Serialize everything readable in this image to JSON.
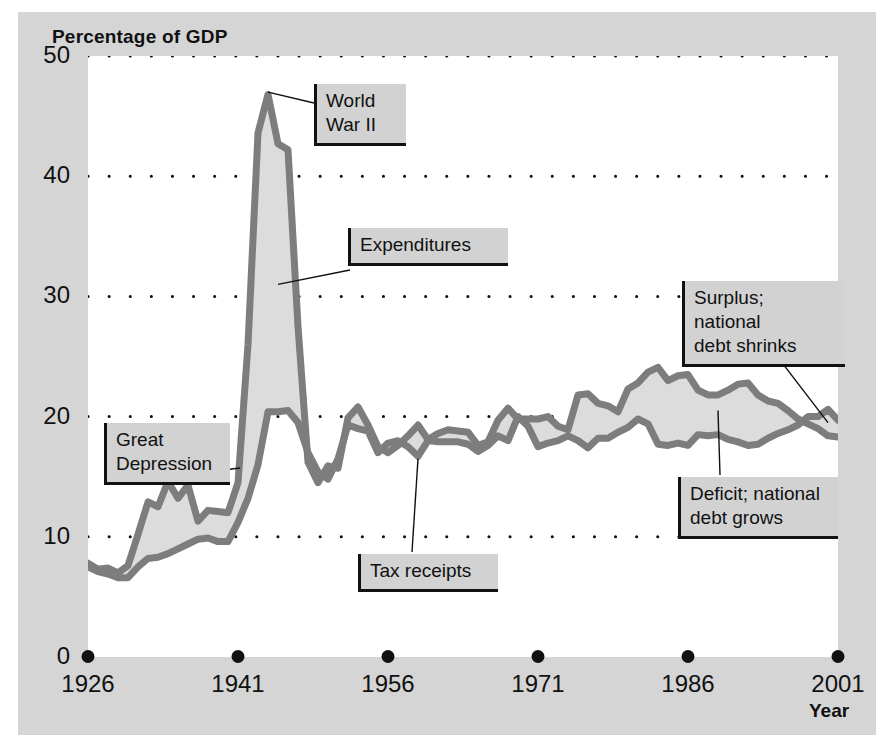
{
  "chart_data": {
    "type": "area",
    "title": "",
    "xlabel": "Year",
    "ylabel": "Percentage of GDP",
    "xlim": [
      1926,
      2001
    ],
    "ylim": [
      0,
      50
    ],
    "grid": true,
    "legend_position": "none",
    "x_tick_labels": [
      "1926",
      "1941",
      "1956",
      "1971",
      "1986",
      "2001"
    ],
    "x_ticks": [
      1926,
      1941,
      1956,
      1971,
      1986,
      2001
    ],
    "y_tick_labels": [
      "0",
      "10",
      "20",
      "30",
      "40",
      "50"
    ],
    "y_ticks": [
      0,
      10,
      20,
      30,
      40,
      50
    ],
    "x": [
      1926,
      1927,
      1928,
      1929,
      1930,
      1931,
      1932,
      1933,
      1934,
      1935,
      1936,
      1937,
      1938,
      1939,
      1940,
      1941,
      1942,
      1943,
      1944,
      1945,
      1946,
      1947,
      1948,
      1949,
      1950,
      1951,
      1952,
      1953,
      1954,
      1955,
      1956,
      1957,
      1958,
      1959,
      1960,
      1961,
      1962,
      1963,
      1964,
      1965,
      1966,
      1967,
      1968,
      1969,
      1970,
      1971,
      1972,
      1973,
      1974,
      1975,
      1976,
      1977,
      1978,
      1979,
      1980,
      1981,
      1982,
      1983,
      1984,
      1985,
      1986,
      1987,
      1988,
      1989,
      1990,
      1991,
      1992,
      1993,
      1994,
      1995,
      1996,
      1997,
      1998,
      1999,
      2000,
      2001
    ],
    "series": [
      {
        "name": "Expenditures",
        "color": "#808080",
        "values": [
          7.8,
          7.3,
          7.4,
          7.0,
          7.6,
          10.2,
          12.9,
          12.5,
          14.6,
          13.2,
          14.3,
          11.3,
          12.2,
          12.1,
          12.0,
          14.5,
          26.0,
          43.6,
          46.8,
          42.7,
          42.2,
          27.5,
          16.2,
          14.5,
          15.9,
          15.7,
          19.9,
          20.8,
          19.3,
          17.5,
          17.0,
          17.6,
          18.4,
          19.3,
          18.1,
          18.6,
          18.9,
          18.8,
          18.7,
          17.6,
          17.9,
          19.7,
          20.7,
          19.8,
          19.8,
          19.8,
          20.0,
          19.2,
          18.9,
          21.8,
          21.9,
          21.1,
          20.9,
          20.4,
          22.3,
          22.8,
          23.7,
          24.1,
          23.0,
          23.4,
          23.5,
          22.2,
          21.8,
          21.8,
          22.2,
          22.7,
          22.8,
          21.8,
          21.3,
          21.1,
          20.5,
          19.8,
          19.4,
          19.0,
          18.4,
          18.3
        ]
      },
      {
        "name": "Tax receipts",
        "color": "#808080",
        "values": [
          7.5,
          7.1,
          6.9,
          6.6,
          6.6,
          7.5,
          8.2,
          8.3,
          8.6,
          9.0,
          9.4,
          9.8,
          9.9,
          9.6,
          9.6,
          11.2,
          13.2,
          16.0,
          20.4,
          20.4,
          20.5,
          19.5,
          17.0,
          15.4,
          14.8,
          16.5,
          19.3,
          19.0,
          18.8,
          17.0,
          17.8,
          18.0,
          17.5,
          16.7,
          18.0,
          17.9,
          17.9,
          17.9,
          17.7,
          17.1,
          17.6,
          18.4,
          18.0,
          20.0,
          19.2,
          17.5,
          17.8,
          18.0,
          18.4,
          18.0,
          17.4,
          18.2,
          18.2,
          18.7,
          19.1,
          19.8,
          19.4,
          17.7,
          17.6,
          17.8,
          17.6,
          18.5,
          18.4,
          18.5,
          18.1,
          17.9,
          17.6,
          17.7,
          18.2,
          18.6,
          18.9,
          19.3,
          20.0,
          20.0,
          20.6,
          19.7
        ]
      }
    ],
    "annotations": [
      {
        "id": "great-depression",
        "text": "Great\nDepression",
        "target_year": 1934,
        "target_value": 15.0
      },
      {
        "id": "world-war-2",
        "text": "World\nWar II",
        "target_year": 1944,
        "target_value": 47.0
      },
      {
        "id": "expenditures",
        "text": "Expenditures",
        "target_year": 1945,
        "target_value": 31.0
      },
      {
        "id": "tax-receipts",
        "text": "Tax receipts",
        "target_year": 1959,
        "target_value": 16.5
      },
      {
        "id": "surplus",
        "text": "Surplus; national\ndebt shrinks",
        "target_year": 2000,
        "target_value": 19.5
      },
      {
        "id": "deficit",
        "text": "Deficit; national\ndebt grows",
        "target_year": 1989,
        "target_value": 20.5
      }
    ],
    "fill_color": "#dcdcdc",
    "line_color": "#7d7d7d",
    "background_color": "#d5d5d5",
    "plot_background_color": "#ffffff"
  }
}
